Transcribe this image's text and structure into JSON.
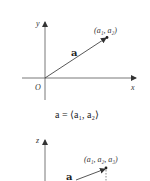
{
  "figure_2d": {
    "axis_x_label": "x",
    "axis_y_label": "y",
    "origin_label": "O",
    "vector_label": "a",
    "point_label": "(a₁, a₂)",
    "caption": "a = ⟨a₁, a₂⟩"
  },
  "figure_3d": {
    "axis_z_label": "z",
    "vector_label": "a",
    "point_label": "(a₁, a₂, a₃)"
  },
  "colors": {
    "ink": "#333333",
    "background": "#ffffff"
  }
}
